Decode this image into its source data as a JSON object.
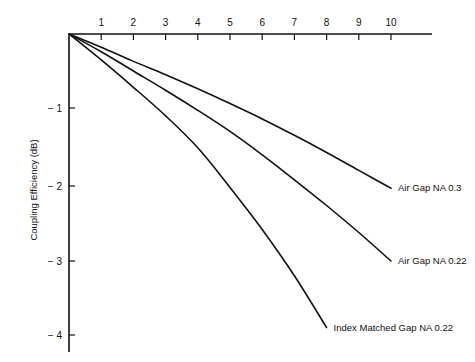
{
  "chart_data": {
    "type": "line",
    "title": "",
    "xlabel": "",
    "ylabel": "Coupling Efficiency (dB)",
    "x_ticks": [
      "1",
      "2",
      "3",
      "4",
      "5",
      "6",
      "7",
      "8",
      "9",
      "10"
    ],
    "y_ticks": [
      "− 1",
      "− 2",
      "− 3",
      "− 4"
    ],
    "xlim": [
      0,
      11.3
    ],
    "ylim": [
      -4.2,
      0
    ],
    "x_axis_position": "top",
    "grid": false,
    "legend": "inline labels at line ends",
    "series": [
      {
        "name": "Air Gap NA 0.3",
        "x": [
          0,
          1,
          2,
          3,
          4,
          5,
          6,
          7,
          8,
          9,
          10
        ],
        "values": [
          0,
          -0.18,
          -0.37,
          -0.55,
          -0.74,
          -0.94,
          -1.14,
          -1.35,
          -1.57,
          -1.8,
          -2.03
        ]
      },
      {
        "name": "Air Gap NA 0.22",
        "x": [
          0,
          1,
          2,
          3,
          4,
          5,
          6,
          7,
          8,
          9,
          10
        ],
        "values": [
          0,
          -0.24,
          -0.5,
          -0.76,
          -1.03,
          -1.3,
          -1.6,
          -1.92,
          -2.26,
          -2.62,
          -3.0
        ]
      },
      {
        "name": "Index Matched Gap NA 0.22",
        "x": [
          0,
          1,
          2,
          3,
          4,
          5,
          6,
          7,
          8
        ],
        "values": [
          0,
          -0.35,
          -0.72,
          -1.1,
          -1.51,
          -2.02,
          -2.58,
          -3.2,
          -3.9
        ]
      }
    ]
  },
  "colors": {
    "line": "#111111",
    "background": "#ffffff"
  }
}
